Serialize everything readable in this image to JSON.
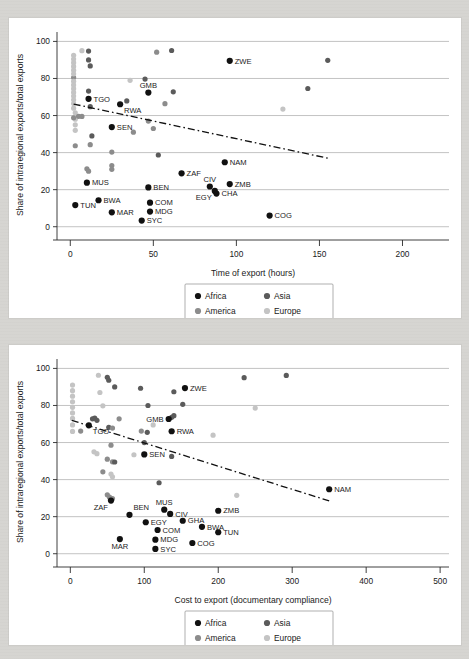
{
  "figure": {
    "background_color": "#d6d5d1",
    "panel_color": "#ffffff"
  },
  "series_colors": {
    "Africa": "#111111",
    "Asia": "#5b5b5b",
    "America": "#8c8c8c",
    "Europe": "#c4c4c4"
  },
  "legend": {
    "items": [
      {
        "label": "Africa",
        "region": "Africa"
      },
      {
        "label": "Asia",
        "region": "Asia"
      },
      {
        "label": "America",
        "region": "America"
      },
      {
        "label": "Europe",
        "region": "Europe"
      }
    ],
    "fitted_label": "Fitted values"
  },
  "chart_data": [
    {
      "id": "top",
      "type": "scatter",
      "title": "",
      "xlabel": "Time of export (hours)",
      "ylabel": "Share of intraregional exports/total exports",
      "xlim": [
        -8,
        228
      ],
      "ylim": [
        -5,
        104
      ],
      "xticks": [
        0,
        50,
        100,
        150,
        200
      ],
      "yticks": [
        0,
        20,
        40,
        60,
        80,
        100
      ],
      "grid": "horizontal",
      "legend_position": "below-axis-center",
      "fitted": {
        "x0": 2,
        "y0": 66.2,
        "x1": 155,
        "y1": 37.0
      },
      "labeled_points": [
        {
          "label": "ZWE",
          "x": 96,
          "y": 89.5,
          "region": "Africa",
          "lp": "right"
        },
        {
          "label": "GMB",
          "x": 47,
          "y": 72.4,
          "region": "Africa",
          "lp": "above"
        },
        {
          "label": "TGO",
          "x": 11,
          "y": 69.0,
          "region": "Africa",
          "lp": "right"
        },
        {
          "label": "RWA",
          "x": 30,
          "y": 66.1,
          "region": "Africa",
          "lp": "below-right"
        },
        {
          "label": "SEN",
          "x": 25,
          "y": 53.8,
          "region": "Africa",
          "lp": "right"
        },
        {
          "label": "NAM",
          "x": 93,
          "y": 34.8,
          "region": "Africa",
          "lp": "right"
        },
        {
          "label": "ZAF",
          "x": 67,
          "y": 28.8,
          "region": "Africa",
          "lp": "right"
        },
        {
          "label": "CIV",
          "x": 84,
          "y": 21.7,
          "region": "Africa",
          "lp": "above"
        },
        {
          "label": "ZMB",
          "x": 96,
          "y": 23.0,
          "region": "Africa",
          "lp": "right"
        },
        {
          "label": "CHA",
          "x": 88,
          "y": 17.9,
          "region": "Africa",
          "lp": "right"
        },
        {
          "label": "EGY",
          "x": 87,
          "y": 19.3,
          "region": "Africa",
          "lp": "below-left"
        },
        {
          "label": "BEN",
          "x": 47,
          "y": 21.2,
          "region": "Africa",
          "lp": "right"
        },
        {
          "label": "MUS",
          "x": 10,
          "y": 23.8,
          "region": "Africa",
          "lp": "right"
        },
        {
          "label": "BWA",
          "x": 17,
          "y": 14.3,
          "region": "Africa",
          "lp": "right"
        },
        {
          "label": "TUN",
          "x": 3,
          "y": 11.7,
          "region": "Africa",
          "lp": "right"
        },
        {
          "label": "MAR",
          "x": 25,
          "y": 7.8,
          "region": "Africa",
          "lp": "right"
        },
        {
          "label": "COM",
          "x": 48,
          "y": 13.0,
          "region": "Africa",
          "lp": "right"
        },
        {
          "label": "MDG",
          "x": 48,
          "y": 8.2,
          "region": "Africa",
          "lp": "right"
        },
        {
          "label": "SYC",
          "x": 43,
          "y": 3.3,
          "region": "Africa",
          "lp": "right"
        },
        {
          "label": "COG",
          "x": 120,
          "y": 6.0,
          "region": "Africa",
          "lp": "right"
        }
      ],
      "unlabeled_points": [
        {
          "x": 11,
          "y": 94.8,
          "region": "Asia"
        },
        {
          "x": 7,
          "y": 95.0,
          "region": "Europe"
        },
        {
          "x": 11,
          "y": 90.0,
          "region": "Asia"
        },
        {
          "x": 12,
          "y": 86.8,
          "region": "Asia"
        },
        {
          "x": 52,
          "y": 94.2,
          "region": "America"
        },
        {
          "x": 61,
          "y": 95.1,
          "region": "Asia"
        },
        {
          "x": 155,
          "y": 89.8,
          "region": "Asia"
        },
        {
          "x": 143,
          "y": 74.6,
          "region": "Asia"
        },
        {
          "x": 128,
          "y": 63.5,
          "region": "Europe"
        },
        {
          "x": 2,
          "y": 80.5,
          "region": "America"
        },
        {
          "x": 2,
          "y": 92.5,
          "region": "Europe"
        },
        {
          "x": 2,
          "y": 90.5,
          "region": "Europe"
        },
        {
          "x": 2,
          "y": 88.5,
          "region": "Europe"
        },
        {
          "x": 2,
          "y": 86.5,
          "region": "Europe"
        },
        {
          "x": 2,
          "y": 84.5,
          "region": "Europe"
        },
        {
          "x": 2,
          "y": 82.5,
          "region": "Europe"
        },
        {
          "x": 2,
          "y": 78.5,
          "region": "Europe"
        },
        {
          "x": 2,
          "y": 76.5,
          "region": "Europe"
        },
        {
          "x": 2,
          "y": 74.5,
          "region": "Europe"
        },
        {
          "x": 2,
          "y": 72.5,
          "region": "Europe"
        },
        {
          "x": 2,
          "y": 70.5,
          "region": "Europe"
        },
        {
          "x": 2,
          "y": 68.5,
          "region": "Europe"
        },
        {
          "x": 2,
          "y": 66.5,
          "region": "Europe"
        },
        {
          "x": 2,
          "y": 64.0,
          "region": "Europe"
        },
        {
          "x": 3,
          "y": 61.5,
          "region": "Europe"
        },
        {
          "x": 3,
          "y": 58.0,
          "region": "Europe"
        },
        {
          "x": 3,
          "y": 55.0,
          "region": "Europe"
        },
        {
          "x": 3,
          "y": 52.0,
          "region": "Europe"
        },
        {
          "x": 2,
          "y": 58.8,
          "region": "America"
        },
        {
          "x": 5,
          "y": 59.6,
          "region": "America"
        },
        {
          "x": 7,
          "y": 59.5,
          "region": "America"
        },
        {
          "x": 3,
          "y": 43.7,
          "region": "America"
        },
        {
          "x": 11,
          "y": 73.2,
          "region": "Asia"
        },
        {
          "x": 12,
          "y": 64.8,
          "region": "Asia"
        },
        {
          "x": 13,
          "y": 49.0,
          "region": "Asia"
        },
        {
          "x": 12,
          "y": 44.3,
          "region": "America"
        },
        {
          "x": 10,
          "y": 31.3,
          "region": "America"
        },
        {
          "x": 11,
          "y": 30.0,
          "region": "America"
        },
        {
          "x": 25,
          "y": 40.3,
          "region": "America"
        },
        {
          "x": 25,
          "y": 33.0,
          "region": "America"
        },
        {
          "x": 25,
          "y": 31.0,
          "region": "America"
        },
        {
          "x": 36,
          "y": 79.0,
          "region": "Europe"
        },
        {
          "x": 34,
          "y": 67.9,
          "region": "Asia"
        },
        {
          "x": 38,
          "y": 51.0,
          "region": "America"
        },
        {
          "x": 45,
          "y": 79.7,
          "region": "Asia"
        },
        {
          "x": 47,
          "y": 57.0,
          "region": "America"
        },
        {
          "x": 50,
          "y": 53.0,
          "region": "America"
        },
        {
          "x": 53,
          "y": 38.7,
          "region": "Asia"
        },
        {
          "x": 57,
          "y": 66.4,
          "region": "America"
        },
        {
          "x": 62,
          "y": 72.8,
          "region": "Asia"
        }
      ]
    },
    {
      "id": "bottom",
      "type": "scatter",
      "title": "",
      "xlabel": "Cost to export (documentary compliance)",
      "ylabel": "Share of intraregional exports/total exports",
      "xlim": [
        -18,
        512
      ],
      "ylim": [
        -5,
        104
      ],
      "xticks": [
        0,
        100,
        200,
        300,
        400,
        500
      ],
      "yticks": [
        0,
        20,
        40,
        60,
        80,
        100
      ],
      "grid": "horizontal",
      "legend_position": "below-axis-center",
      "fitted": {
        "x0": 2,
        "y0": 72.0,
        "x1": 350,
        "y1": 28.5
      },
      "labeled_points": [
        {
          "label": "ZWE",
          "x": 155,
          "y": 89.4,
          "region": "Africa",
          "lp": "right"
        },
        {
          "label": "GMB",
          "x": 133,
          "y": 72.7,
          "region": "Africa",
          "lp": "left"
        },
        {
          "label": "TGO",
          "x": 25,
          "y": 69.3,
          "region": "Africa",
          "lp": "below-right"
        },
        {
          "label": "RWA",
          "x": 137,
          "y": 66.1,
          "region": "Africa",
          "lp": "right"
        },
        {
          "label": "SEN",
          "x": 100,
          "y": 53.6,
          "region": "Africa",
          "lp": "right"
        },
        {
          "label": "NAM",
          "x": 350,
          "y": 34.8,
          "region": "Africa",
          "lp": "right"
        },
        {
          "label": "ZAF",
          "x": 55,
          "y": 28.7,
          "region": "Africa",
          "lp": "below-left"
        },
        {
          "label": "BEN",
          "x": 80,
          "y": 21.0,
          "region": "Africa",
          "lp": "above-right"
        },
        {
          "label": "MUS",
          "x": 127,
          "y": 23.8,
          "region": "Africa",
          "lp": "above"
        },
        {
          "label": "CIV",
          "x": 135,
          "y": 21.5,
          "region": "Africa",
          "lp": "right"
        },
        {
          "label": "ZMB",
          "x": 200,
          "y": 23.2,
          "region": "Africa",
          "lp": "right"
        },
        {
          "label": "EGY",
          "x": 102,
          "y": 17.0,
          "region": "Africa",
          "lp": "right"
        },
        {
          "label": "GHA",
          "x": 152,
          "y": 17.8,
          "region": "Africa",
          "lp": "right"
        },
        {
          "label": "BWA",
          "x": 178,
          "y": 14.5,
          "region": "Africa",
          "lp": "right"
        },
        {
          "label": "COM",
          "x": 118,
          "y": 12.8,
          "region": "Africa",
          "lp": "right"
        },
        {
          "label": "TUN",
          "x": 200,
          "y": 11.6,
          "region": "Africa",
          "lp": "right"
        },
        {
          "label": "MDG",
          "x": 115,
          "y": 7.6,
          "region": "Africa",
          "lp": "right"
        },
        {
          "label": "MAR",
          "x": 67,
          "y": 7.9,
          "region": "Africa",
          "lp": "below"
        },
        {
          "label": "SYC",
          "x": 115,
          "y": 2.6,
          "region": "Africa",
          "lp": "right"
        },
        {
          "label": "COG",
          "x": 165,
          "y": 5.8,
          "region": "Africa",
          "lp": "right"
        }
      ],
      "unlabeled_points": [
        {
          "x": 235,
          "y": 95.0,
          "region": "Asia"
        },
        {
          "x": 292,
          "y": 96.2,
          "region": "Asia"
        },
        {
          "x": 50,
          "y": 95.2,
          "region": "Asia"
        },
        {
          "x": 38,
          "y": 96.3,
          "region": "Europe"
        },
        {
          "x": 52,
          "y": 93.6,
          "region": "Asia"
        },
        {
          "x": 60,
          "y": 90.0,
          "region": "Asia"
        },
        {
          "x": 95,
          "y": 89.3,
          "region": "Asia"
        },
        {
          "x": 140,
          "y": 87.4,
          "region": "Asia"
        },
        {
          "x": 40,
          "y": 87.0,
          "region": "Europe"
        },
        {
          "x": 152,
          "y": 80.6,
          "region": "Asia"
        },
        {
          "x": 105,
          "y": 80.0,
          "region": "Asia"
        },
        {
          "x": 44,
          "y": 79.8,
          "region": "Europe"
        },
        {
          "x": 250,
          "y": 78.6,
          "region": "Europe"
        },
        {
          "x": 3,
          "y": 91.0,
          "region": "Europe"
        },
        {
          "x": 3,
          "y": 88.0,
          "region": "Europe"
        },
        {
          "x": 3,
          "y": 85.0,
          "region": "Europe"
        },
        {
          "x": 3,
          "y": 82.0,
          "region": "Europe"
        },
        {
          "x": 3,
          "y": 79.0,
          "region": "Europe"
        },
        {
          "x": 3,
          "y": 76.0,
          "region": "Europe"
        },
        {
          "x": 3,
          "y": 73.0,
          "region": "Europe"
        },
        {
          "x": 3,
          "y": 69.5,
          "region": "Europe"
        },
        {
          "x": 3,
          "y": 66.0,
          "region": "Europe"
        },
        {
          "x": 14,
          "y": 66.2,
          "region": "America"
        },
        {
          "x": 33,
          "y": 73.2,
          "region": "Asia"
        },
        {
          "x": 36,
          "y": 72.0,
          "region": "Asia"
        },
        {
          "x": 30,
          "y": 72.8,
          "region": "Asia"
        },
        {
          "x": 52,
          "y": 68.2,
          "region": "Asia"
        },
        {
          "x": 57,
          "y": 67.8,
          "region": "America"
        },
        {
          "x": 66,
          "y": 72.8,
          "region": "America"
        },
        {
          "x": 96,
          "y": 66.2,
          "region": "America"
        },
        {
          "x": 104,
          "y": 65.5,
          "region": "Asia"
        },
        {
          "x": 112,
          "y": 69.5,
          "region": "Europe"
        },
        {
          "x": 140,
          "y": 74.5,
          "region": "Asia"
        },
        {
          "x": 137,
          "y": 73.6,
          "region": "Asia"
        },
        {
          "x": 100,
          "y": 60.0,
          "region": "Asia"
        },
        {
          "x": 55,
          "y": 58.6,
          "region": "America"
        },
        {
          "x": 50,
          "y": 51.0,
          "region": "America"
        },
        {
          "x": 57,
          "y": 49.6,
          "region": "America"
        },
        {
          "x": 60,
          "y": 49.5,
          "region": "Asia"
        },
        {
          "x": 86,
          "y": 53.4,
          "region": "Europe"
        },
        {
          "x": 137,
          "y": 52.5,
          "region": "Asia"
        },
        {
          "x": 193,
          "y": 64.0,
          "region": "Europe"
        },
        {
          "x": 32,
          "y": 55.0,
          "region": "Europe"
        },
        {
          "x": 36,
          "y": 54.0,
          "region": "Europe"
        },
        {
          "x": 44,
          "y": 44.2,
          "region": "America"
        },
        {
          "x": 55,
          "y": 43.0,
          "region": "Europe"
        },
        {
          "x": 57,
          "y": 41.5,
          "region": "Europe"
        },
        {
          "x": 120,
          "y": 38.3,
          "region": "Asia"
        },
        {
          "x": 50,
          "y": 31.8,
          "region": "America"
        },
        {
          "x": 53,
          "y": 30.5,
          "region": "America"
        },
        {
          "x": 57,
          "y": 29.8,
          "region": "America"
        },
        {
          "x": 225,
          "y": 31.5,
          "region": "Europe"
        }
      ]
    }
  ]
}
